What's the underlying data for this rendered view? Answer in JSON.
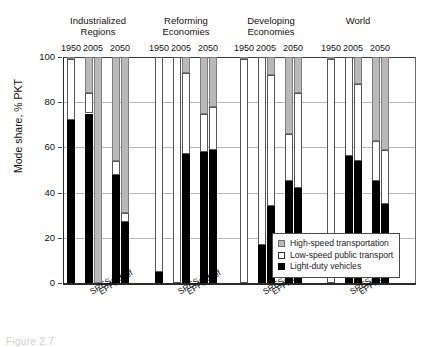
{
  "figure": {
    "caption": "Figure 2.7"
  },
  "axes": {
    "ylabel": "Mode share, % PKT",
    "yticks": [
      "0",
      "20",
      "40",
      "60",
      "80",
      "100"
    ],
    "ymin": 0,
    "ymax": 100
  },
  "legend": {
    "items": [
      {
        "label": "High-speed transportation",
        "key": "high_speed",
        "color": "#b9b9b9"
      },
      {
        "label": "Low-speed public transport",
        "key": "low_speed",
        "color": "#ffffff"
      },
      {
        "label": "Light-duty vehicles",
        "key": "light_duty",
        "color": "#000000"
      }
    ]
  },
  "chart_data": {
    "type": "bar",
    "subtype": "stacked",
    "title": "",
    "xlabel": "",
    "ylabel": "Mode share, % PKT",
    "ylim": [
      0,
      100
    ],
    "grid": true,
    "legend_position": "inside-lower-right",
    "legend_entries": [
      "High-speed transportation",
      "Low-speed public transport",
      "Light-duty vehicles"
    ],
    "group_labels": [
      "Industrialized Regions",
      "Reforming Economies",
      "Developing Economies",
      "World"
    ],
    "year_labels": [
      "1950",
      "2005",
      "2050"
    ],
    "scenario_labels": [
      "SRES-B1",
      "EPPA-Ref"
    ],
    "series": [
      {
        "name": "Light-duty vehicles",
        "color": "#000000"
      },
      {
        "name": "Low-speed public transport",
        "color": "#ffffff"
      },
      {
        "name": "High-speed transportation",
        "color": "#b9b9b9"
      }
    ],
    "groups": [
      {
        "label": "Industrialized Regions",
        "bars": [
          {
            "year": "1950",
            "scenario": "",
            "light_duty": 72,
            "low_speed": 27,
            "high_speed": 1
          },
          {
            "year": "2005",
            "scenario": "SRES-B1",
            "light_duty": 75,
            "low_speed": 9,
            "high_speed": 16
          },
          {
            "year": "2005",
            "scenario": "EPPA-Ref",
            "light_duty": 0,
            "low_speed": 0,
            "high_speed": 100
          },
          {
            "year": "2050",
            "scenario": "SRES-B1",
            "light_duty": 48,
            "low_speed": 6,
            "high_speed": 46
          },
          {
            "year": "2050",
            "scenario": "EPPA-Ref",
            "light_duty": 27,
            "low_speed": 4,
            "high_speed": 69
          }
        ]
      },
      {
        "label": "Reforming Economies",
        "bars": [
          {
            "year": "1950",
            "scenario": "",
            "light_duty": 5,
            "low_speed": 95,
            "high_speed": 0
          },
          {
            "year": "2005",
            "scenario": "SRES-B1",
            "light_duty": 0,
            "low_speed": 100,
            "high_speed": 0
          },
          {
            "year": "2005",
            "scenario": "EPPA-Ref",
            "light_duty": 57,
            "low_speed": 36,
            "high_speed": 7
          },
          {
            "year": "2050",
            "scenario": "SRES-B1",
            "light_duty": 58,
            "low_speed": 17,
            "high_speed": 25
          },
          {
            "year": "2050",
            "scenario": "EPPA-Ref",
            "light_duty": 59,
            "low_speed": 19,
            "high_speed": 22
          }
        ]
      },
      {
        "label": "Developing Economies",
        "bars": [
          {
            "year": "1950",
            "scenario": "",
            "light_duty": 0,
            "low_speed": 99,
            "high_speed": 1
          },
          {
            "year": "2005",
            "scenario": "SRES-B1",
            "light_duty": 17,
            "low_speed": 83,
            "high_speed": 0
          },
          {
            "year": "2005",
            "scenario": "EPPA-Ref",
            "light_duty": 34,
            "low_speed": 58,
            "high_speed": 8
          },
          {
            "year": "2050",
            "scenario": "SRES-B1",
            "light_duty": 45,
            "low_speed": 21,
            "high_speed": 34
          },
          {
            "year": "2050",
            "scenario": "EPPA-Ref",
            "light_duty": 42,
            "low_speed": 42,
            "high_speed": 16
          }
        ]
      },
      {
        "label": "World",
        "bars": [
          {
            "year": "1950",
            "scenario": "",
            "light_duty": 0,
            "low_speed": 99,
            "high_speed": 1
          },
          {
            "year": "2005",
            "scenario": "SRES-B1",
            "light_duty": 56,
            "low_speed": 44,
            "high_speed": 0
          },
          {
            "year": "2005",
            "scenario": "EPPA-Ref",
            "light_duty": 54,
            "low_speed": 34,
            "high_speed": 12
          },
          {
            "year": "2050",
            "scenario": "SRES-B1",
            "light_duty": 45,
            "low_speed": 18,
            "high_speed": 37
          },
          {
            "year": "2050",
            "scenario": "EPPA-Ref",
            "light_duty": 35,
            "low_speed": 24,
            "high_speed": 41
          }
        ]
      }
    ]
  }
}
